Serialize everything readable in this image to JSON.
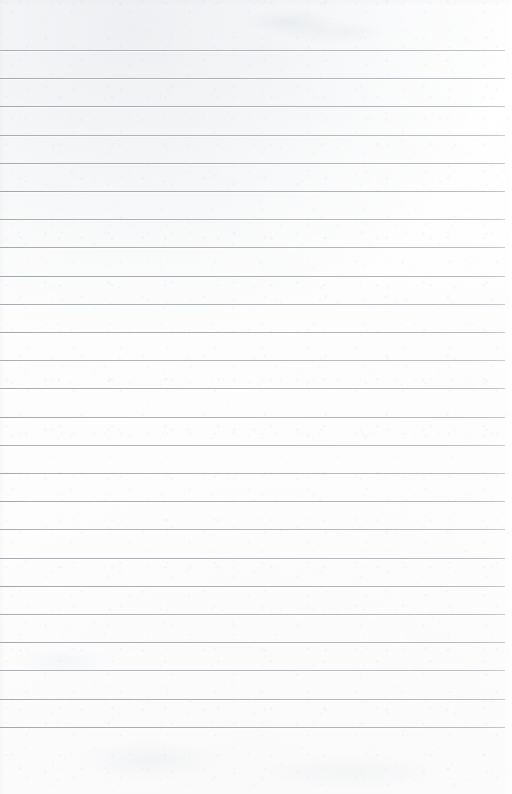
{
  "document": {
    "type": "lined-paper-scan",
    "content_text": "",
    "is_blank": true,
    "page_width": 512,
    "page_height": 794
  },
  "paper": {
    "background_color": "#fdfdfd",
    "edge_color": "#ffffff",
    "texture": "subtle-scan-grain"
  },
  "ruling": {
    "line_color": "#a8acb0",
    "line_color_left": "#9ea2a7",
    "line_color_right": "#bcc0c4",
    "line_thickness_px": 1,
    "line_spacing_px": 28.2,
    "first_line_y": 50,
    "last_line_y": 739,
    "line_start_x": 0,
    "line_end_x": 505,
    "line_count": 25,
    "top_margin_px": 50,
    "bottom_margin_px": 55,
    "right_margin_px": 7,
    "lines_y": [
      50,
      78.2,
      106.4,
      134.6,
      162.8,
      191,
      219.2,
      247.4,
      275.6,
      303.8,
      332,
      360.2,
      388.4,
      416.6,
      444.8,
      473,
      501.2,
      529.4,
      557.6,
      585.8,
      614,
      642.2,
      670.4,
      698.6,
      726.8
    ]
  }
}
